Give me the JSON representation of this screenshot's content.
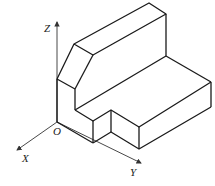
{
  "diagram": {
    "type": "isometric-solid",
    "axes": {
      "z_label": "Z",
      "x_label": "X",
      "y_label": "Y",
      "origin_label": "O"
    },
    "colors": {
      "line": "#1a1a1a",
      "axis": "#333333",
      "background": "#ffffff"
    }
  }
}
